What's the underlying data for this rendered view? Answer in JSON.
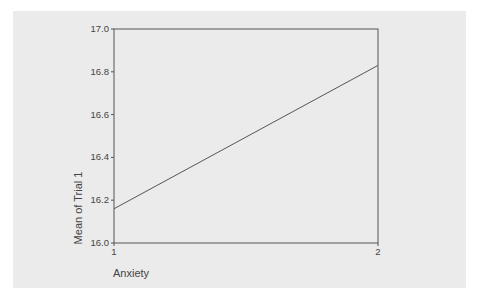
{
  "chart_data": {
    "type": "line",
    "title": "",
    "xlabel": "Anxiety",
    "ylabel": "Mean of Trial 1",
    "categories": [
      "1",
      "2"
    ],
    "x": [
      1,
      2
    ],
    "series": [
      {
        "name": "Mean of Trial 1",
        "values": [
          16.16,
          16.83
        ]
      }
    ],
    "ylim": [
      16.0,
      17.0
    ],
    "yticks": [
      "16.0",
      "16.2",
      "16.4",
      "16.6",
      "16.8",
      "17.0"
    ],
    "xticks": [
      "1",
      "2"
    ],
    "grid": false,
    "legend": null
  },
  "colors": {
    "background": "#ebebeb",
    "frame": "#555555",
    "line": "#555555",
    "text": "#444444"
  }
}
